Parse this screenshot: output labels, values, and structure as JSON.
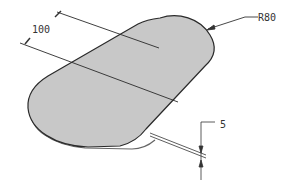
{
  "drawing": {
    "type": "isometric-part-sketch",
    "part": "obround-plate",
    "colors": {
      "background": "#ffffff",
      "part_fill": "#c8c8c8",
      "outline": "#2a2a2a",
      "dimension_line": "#333333",
      "text": "#333333"
    },
    "dimensions": {
      "width": {
        "label": "100"
      },
      "radius": {
        "label": "R80"
      },
      "thickness": {
        "label": "5"
      }
    }
  }
}
